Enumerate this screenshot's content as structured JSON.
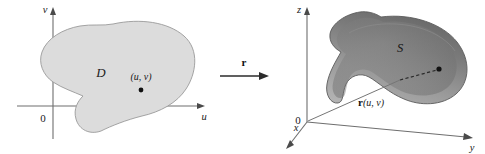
{
  "figure": {
    "kind": "math-diagram",
    "background_color": "#ffffff"
  },
  "left_panel": {
    "name": "uv-plane",
    "axes": {
      "vertical_label": "v",
      "horizontal_label": "u",
      "origin_label": "0"
    },
    "region": {
      "label": "D",
      "fill_color": "#dcdcdc",
      "stroke_color": "#9a9a9a"
    },
    "point": {
      "label": "(u, v)",
      "dot_color": "#111111"
    }
  },
  "mapping_arrow": {
    "label": "r",
    "label_is_bold": true,
    "color": "#2b2b2b"
  },
  "right_panel": {
    "name": "xyz-space",
    "axes": {
      "vertical_label": "z",
      "right_label": "y",
      "front_label": "x",
      "origin_label": "0"
    },
    "surface": {
      "label": "S",
      "fill_top_color": "#6e6e6e",
      "fill_bottom_color": "#a8a8a8",
      "stroke_color": "#4d4d4d"
    },
    "vector": {
      "label": "r(u, v)",
      "bold_part": "r",
      "arg_part": "(u, v)"
    },
    "point": {
      "dot_color": "#111111"
    }
  }
}
